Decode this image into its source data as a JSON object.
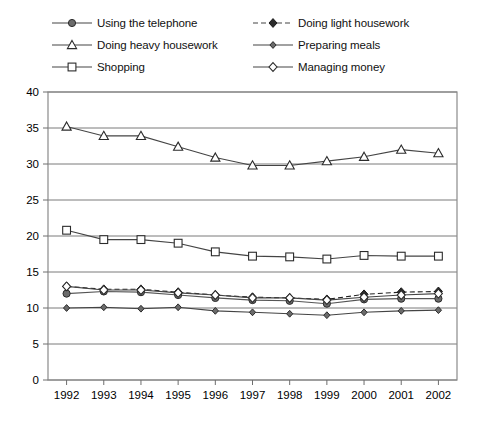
{
  "chart_data": {
    "type": "line",
    "title": "",
    "subtitle": "",
    "xlabel": "",
    "ylabel": "",
    "categories": [
      "1992",
      "1993",
      "1994",
      "1995",
      "1996",
      "1997",
      "1998",
      "1999",
      "2000",
      "2001",
      "2002"
    ],
    "x": [
      1992,
      1993,
      1994,
      1995,
      1996,
      1997,
      1998,
      1999,
      2000,
      2001,
      2002
    ],
    "ylim": [
      0,
      40
    ],
    "ytick_step": 5,
    "yticks": [
      "0",
      "5",
      "10",
      "15",
      "20",
      "25",
      "30",
      "35",
      "40"
    ],
    "grid": "horizontal",
    "legend_position": "top",
    "series": [
      {
        "name": "Using the telephone",
        "marker": "filled-circle",
        "line": "solid",
        "color": "#555555",
        "values": [
          12.0,
          12.3,
          12.2,
          11.8,
          11.4,
          11.1,
          11.0,
          10.6,
          11.2,
          11.3,
          11.3
        ]
      },
      {
        "name": "Doing light housework",
        "marker": "filled-diamond",
        "line": "dashed",
        "color": "#222222",
        "values": [
          13.0,
          12.6,
          12.6,
          12.2,
          11.8,
          11.5,
          11.4,
          11.2,
          11.9,
          12.2,
          12.3
        ]
      },
      {
        "name": "Doing heavy housework",
        "marker": "open-triangle",
        "line": "solid",
        "color": "#444444",
        "values": [
          35.2,
          33.9,
          33.9,
          32.4,
          30.9,
          29.8,
          29.8,
          30.4,
          31.0,
          32.0,
          31.5
        ]
      },
      {
        "name": "Preparing meals",
        "marker": "small-filled-diamond",
        "line": "solid",
        "color": "#444444",
        "values": [
          10.0,
          10.1,
          9.9,
          10.1,
          9.6,
          9.4,
          9.2,
          9.0,
          9.4,
          9.6,
          9.7
        ]
      },
      {
        "name": "Shopping",
        "marker": "open-square",
        "line": "solid",
        "color": "#444444",
        "values": [
          20.8,
          19.5,
          19.5,
          19.0,
          17.8,
          17.2,
          17.1,
          16.8,
          17.3,
          17.2,
          17.2
        ]
      },
      {
        "name": "Managing money",
        "marker": "open-diamond",
        "line": "solid",
        "color": "#444444",
        "values": [
          13.0,
          12.5,
          12.5,
          12.1,
          11.8,
          11.4,
          11.4,
          11.1,
          11.5,
          11.8,
          12.0
        ]
      }
    ]
  },
  "legend": {
    "entries": [
      {
        "label": "Using the telephone",
        "marker": "filled-circle",
        "line": "solid",
        "column": "left",
        "row": 0
      },
      {
        "label": "Doing light housework",
        "marker": "filled-diamond",
        "line": "dashed",
        "column": "right",
        "row": 0
      },
      {
        "label": "Doing heavy housework",
        "marker": "open-triangle",
        "line": "solid",
        "column": "left",
        "row": 1
      },
      {
        "label": "Preparing meals",
        "marker": "small-filled-diamond",
        "line": "solid",
        "column": "right",
        "row": 1
      },
      {
        "label": "Shopping",
        "marker": "open-square",
        "line": "solid",
        "column": "left",
        "row": 2
      },
      {
        "label": "Managing money",
        "marker": "open-diamond",
        "line": "solid",
        "column": "right",
        "row": 2
      }
    ]
  },
  "colors": {
    "axis": "#6e6e6e",
    "grid": "#7a7a7a",
    "frame": "#8a8a8a",
    "text": "#000000",
    "background": "#ffffff"
  }
}
